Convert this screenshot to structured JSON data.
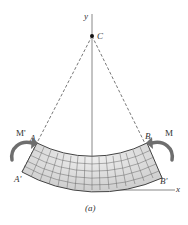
{
  "figure": {
    "caption": "(a)",
    "axes": {
      "y_label": "y",
      "x_label": "x"
    },
    "center_point": {
      "label": "C"
    },
    "beam": {
      "top_left_label": "A",
      "top_right_label": "B",
      "bottom_left_label": "A'",
      "bottom_right_label": "B'",
      "fill_color": "#d9d9d9",
      "grid_color": "#555555"
    },
    "moments": {
      "left_label": "M'",
      "right_label": "M",
      "arrow_color": "#6e6e6e"
    }
  }
}
